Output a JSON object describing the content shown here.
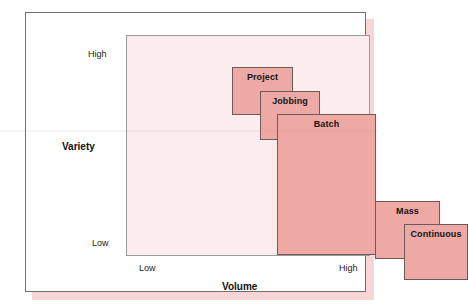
{
  "chart_data": {
    "type": "diagram",
    "xlabel": "Volume",
    "ylabel": "Variety",
    "x_ticks": [
      "Low",
      "High"
    ],
    "y_ticks": [
      "High",
      "Low"
    ],
    "grid": false,
    "legend": "none",
    "boxes": [
      {
        "label": "Project",
        "volume": "very low",
        "variety": "very high",
        "x": [
          0.02,
          0.27
        ],
        "y": [
          0.96,
          0.74
        ]
      },
      {
        "label": "Jobbing",
        "volume": "low",
        "variety": "high",
        "x": [
          0.14,
          0.39
        ],
        "y": [
          0.85,
          0.63
        ]
      },
      {
        "label": "Batch",
        "volume": "medium",
        "variety": "medium",
        "x": [
          0.21,
          0.62
        ],
        "y": [
          0.75,
          0.11
        ]
      },
      {
        "label": "Mass",
        "volume": "high",
        "variety": "low",
        "x": [
          0.61,
          0.88
        ],
        "y": [
          0.36,
          0.1
        ]
      },
      {
        "label": "Continuous",
        "volume": "very high",
        "variety": "very low",
        "x": [
          0.73,
          0.99
        ],
        "y": [
          0.25,
          0.0
        ]
      }
    ]
  },
  "figure": {
    "axes": {
      "x_title": "Volume",
      "y_title": "Variety",
      "x_tick_low": "Low",
      "x_tick_high": "High",
      "y_tick_high": "High",
      "y_tick_low": "Low"
    },
    "boxes": {
      "project": "Project",
      "jobbing": "Jobbing",
      "batch": "Batch",
      "mass": "Mass",
      "continuous": "Continuous"
    },
    "colors": {
      "box_fill": "#efa9a5",
      "box_border": "#6b5a58",
      "plot_background": "#fbeded",
      "frame_border": "#6e6e6e",
      "shadow": "#f8d6d6",
      "page_background": "#ffffff",
      "text": "#101010"
    }
  }
}
